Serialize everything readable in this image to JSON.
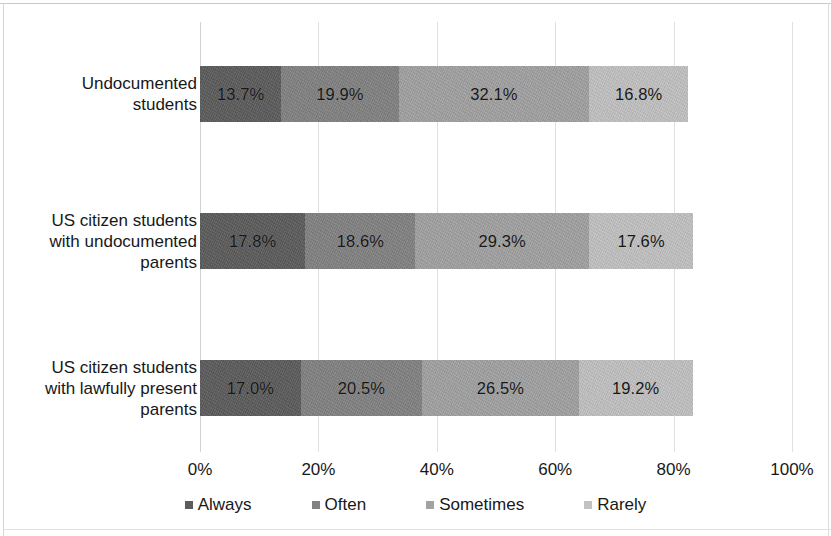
{
  "chart_data": {
    "type": "bar",
    "orientation": "horizontal",
    "stacked": true,
    "title": "",
    "subtitle": "",
    "xlabel": "",
    "ylabel": "",
    "xlim": [
      0,
      100
    ],
    "xticks": [
      "0%",
      "20%",
      "40%",
      "60%",
      "80%",
      "100%"
    ],
    "xtick_values": [
      0,
      20,
      40,
      60,
      80,
      100
    ],
    "grid": true,
    "legend_position": "bottom",
    "categories": [
      "Undocumented students",
      "US citizen students with undocumented parents",
      "US citizen students with lawfully present parents"
    ],
    "category_lines": [
      [
        "Undocumented",
        "students"
      ],
      [
        "US citizen students",
        "with undocumented",
        "parents"
      ],
      [
        "US citizen students",
        "with lawfully present",
        "parents"
      ]
    ],
    "series": [
      {
        "name": "Always",
        "color": "#5c5c5c",
        "values": [
          13.7,
          17.8,
          17.0
        ],
        "labels": [
          "13.7%",
          "17.8%",
          "17.0%"
        ]
      },
      {
        "name": "Often",
        "color": "#828282",
        "values": [
          19.9,
          18.6,
          20.5
        ],
        "labels": [
          "19.9%",
          "18.6%",
          "20.5%"
        ]
      },
      {
        "name": "Sometimes",
        "color": "#a2a2a2",
        "values": [
          32.1,
          29.3,
          26.5
        ],
        "labels": [
          "32.1%",
          "29.3%",
          "26.5%"
        ]
      },
      {
        "name": "Rarely",
        "color": "#c2c2c2",
        "values": [
          16.8,
          17.6,
          19.2
        ],
        "labels": [
          "16.8%",
          "17.6%",
          "19.2%"
        ]
      }
    ]
  }
}
